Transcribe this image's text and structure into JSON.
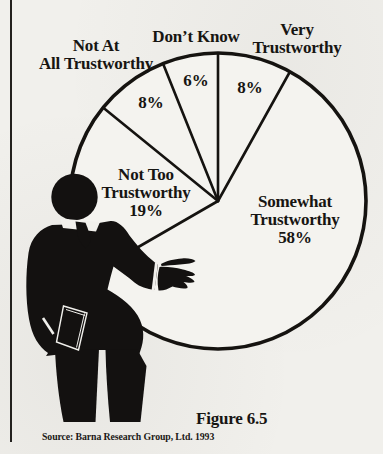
{
  "page": {
    "type": "scanned-book-figure",
    "ink_color": "#171512",
    "paper_color": "#f1f0ec"
  },
  "chart_data": {
    "type": "pie",
    "title": "",
    "categories": [
      "Very Trustworthy",
      "Somewhat Trustworthy",
      "Not Too Trustworthy",
      "Not At All Trustworthy",
      "Don't Know"
    ],
    "values": [
      8,
      58,
      19,
      8,
      6
    ],
    "unit": "percent",
    "start_angle_deg": 0,
    "direction": "clockwise",
    "legend_position": "none",
    "annotation": "black silhouette of a suited presenter gesturing at the pie"
  },
  "labels": {
    "dont_know": {
      "line1": "Don’t Know",
      "pct": "6%"
    },
    "very": {
      "line1": "Very",
      "line2": "Trustworthy",
      "pct": "8%"
    },
    "not_at_all": {
      "line1": "Not At",
      "line2": "All Trustworthy",
      "pct": "8%"
    },
    "not_too": {
      "line1": "Not Too",
      "line2": "Trustworthy",
      "line3": "19%"
    },
    "somewhat": {
      "line1": "Somewhat",
      "line2": "Trustworthy",
      "line3": "58%"
    }
  },
  "figure": {
    "caption": "Figure 6.5",
    "source": "Source: Barna Research Group, Ltd. 1993"
  }
}
